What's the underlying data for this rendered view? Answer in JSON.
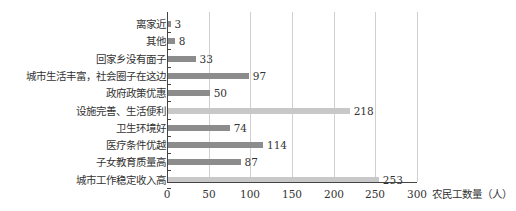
{
  "chart_data": {
    "type": "bar",
    "orientation": "horizontal",
    "title": "",
    "xlabel": "农民工数量（人）",
    "ylabel": "",
    "xlim": [
      0,
      300
    ],
    "xticks": [
      "0",
      "50",
      "100",
      "150",
      "200",
      "250",
      "300"
    ],
    "grid": "vertical",
    "categories": [
      "离家近",
      "其他",
      "回家乡没有面子",
      "城市生活丰富，社会圈子在这边",
      "政府政策优惠",
      "设施完善、生活便利",
      "卫生环境好",
      "医疗条件优越",
      "子女教育质量高",
      "城市工作稳定收入高"
    ],
    "values": [
      3,
      8,
      33,
      97,
      50,
      218,
      74,
      114,
      87,
      253
    ],
    "value_labels": [
      "3",
      "8",
      "33",
      "97",
      "50",
      "218",
      "74",
      "114",
      "87",
      "253"
    ],
    "bar_colors": [
      "#8c8c8c",
      "#8c8c8c",
      "#8c8c8c",
      "#8c8c8c",
      "#8c8c8c",
      "#c8c8c8",
      "#8c8c8c",
      "#8c8c8c",
      "#8c8c8c",
      "#c8c8c8"
    ]
  }
}
